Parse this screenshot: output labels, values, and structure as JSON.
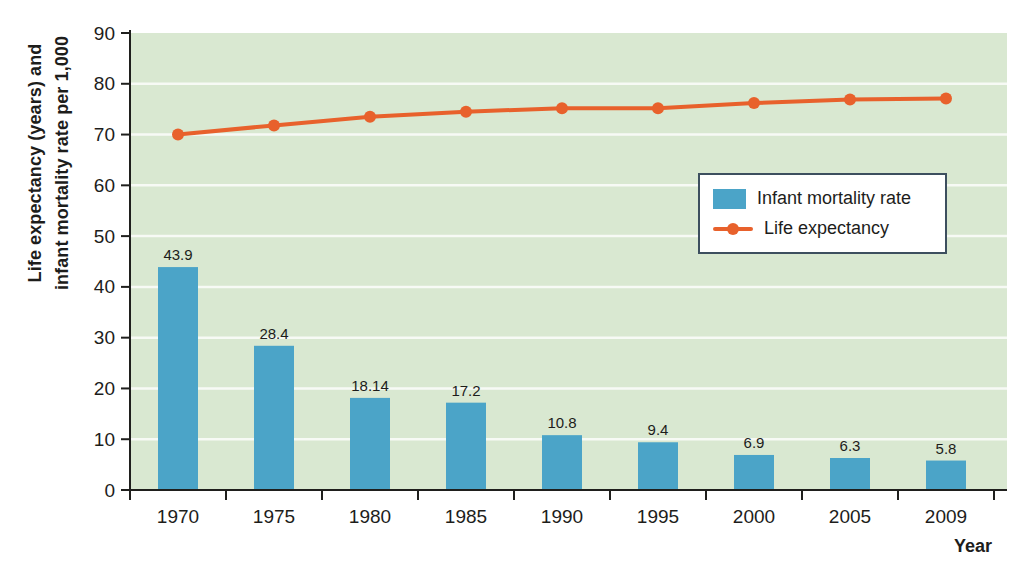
{
  "colors": {
    "page_bg": "#ffffff",
    "plot_bg": "#d9e8d1",
    "grid": "#ffffff",
    "axis": "#1f1f1d",
    "text": "#1d1d1b",
    "bar": "#4ba4c8",
    "line": "#e8612c",
    "legend_border": "#3d4f5f",
    "legend_bg": "#ffffff"
  },
  "chart_data": {
    "type": "combo-bar-line",
    "title": "",
    "categories": [
      "1970",
      "1975",
      "1980",
      "1985",
      "1990",
      "1995",
      "2000",
      "2005",
      "2009"
    ],
    "series": [
      {
        "name": "Infant mortality rate",
        "kind": "bar",
        "color": "#4ba4c8",
        "values": [
          43.9,
          28.4,
          18.14,
          17.2,
          10.8,
          9.4,
          6.9,
          6.3,
          5.8
        ],
        "value_labels": [
          "43.9",
          "28.4",
          "18.14",
          "17.2",
          "10.8",
          "9.4",
          "6.9",
          "6.3",
          "5.8"
        ]
      },
      {
        "name": "Life expectancy",
        "kind": "line",
        "marker": "circle",
        "color": "#e8612c",
        "values": [
          70.0,
          71.8,
          73.5,
          74.5,
          75.2,
          75.2,
          76.2,
          76.9,
          77.1
        ]
      }
    ],
    "xlabel": "Year",
    "ylabel_lines": [
      "Life expectancy (years) and",
      "infant mortality rate per 1,000"
    ],
    "ylim": [
      0,
      90
    ],
    "yticks": [
      0,
      10,
      20,
      30,
      40,
      50,
      60,
      70,
      80,
      90
    ],
    "grid": "horizontal-white-lines",
    "legend_position": "upper-right-inside-plot"
  }
}
